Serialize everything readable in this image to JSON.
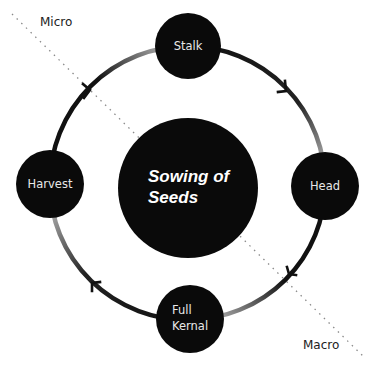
{
  "diagram": {
    "center": {
      "label_line1": "Sowing of",
      "label_line2": "Seeds"
    },
    "nodes": [
      {
        "id": "stalk",
        "label_line1": "Stalk",
        "label_line2": ""
      },
      {
        "id": "head",
        "label_line1": "Head",
        "label_line2": ""
      },
      {
        "id": "full-kernal",
        "label_line1": "Full",
        "label_line2": "Kernal"
      },
      {
        "id": "harvest",
        "label_line1": "Harvest",
        "label_line2": ""
      }
    ],
    "axis": {
      "top_label": "Micro",
      "bottom_label": "Macro"
    },
    "flow_direction": "clockwise",
    "colors": {
      "node_fill": "#0a0a0a",
      "ring_dark": "#111111",
      "ring_light": "#c8c8c8",
      "divider": "#888888"
    }
  }
}
